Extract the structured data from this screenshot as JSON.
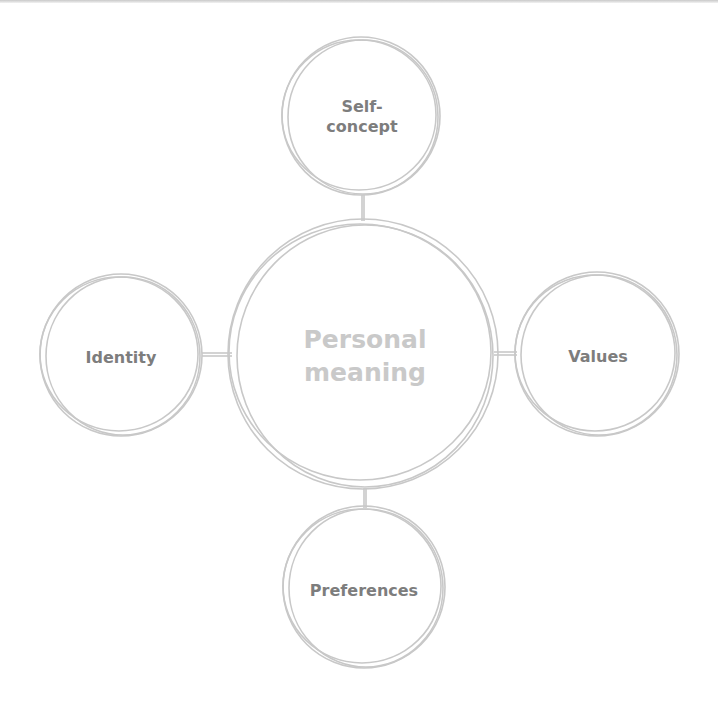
{
  "diagram": {
    "center": {
      "label_line1": "Personal",
      "label_line2": "meaning",
      "cx": 363,
      "cy": 354,
      "r": 135
    },
    "nodes": [
      {
        "id": "self-concept",
        "label_line1": "Self-",
        "label_line2": "concept",
        "cx": 361,
        "cy": 116,
        "r": 79
      },
      {
        "id": "identity",
        "label_line1": "Identity",
        "label_line2": "",
        "cx": 121,
        "cy": 355,
        "r": 81
      },
      {
        "id": "values",
        "label_line1": "Values",
        "label_line2": "",
        "cx": 597,
        "cy": 354,
        "r": 82
      },
      {
        "id": "preferences",
        "label_line1": "Preferences",
        "label_line2": "",
        "cx": 364,
        "cy": 587,
        "r": 81
      }
    ],
    "colors": {
      "stroke": "#c8c8c8",
      "node_text": "#7d7d7d",
      "center_text": "#c9c9c9",
      "background": "#ffffff"
    }
  }
}
